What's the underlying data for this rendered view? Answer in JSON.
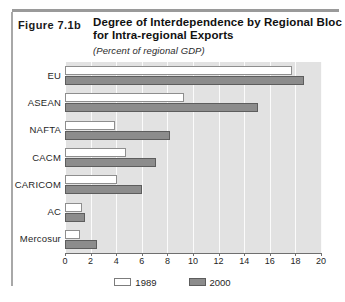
{
  "figure": {
    "label": "Figure 7.1b",
    "title": "Degree of Interdependence by Regional Bloc for Intra-regional Exports",
    "subtitle": "(Percent of regional GDP)"
  },
  "chart_data": {
    "type": "bar",
    "orientation": "horizontal",
    "title": "Degree of Interdependence by Regional Bloc for Intra-regional Exports",
    "subtitle": "(Percent of regional GDP)",
    "xlabel": "",
    "ylabel": "",
    "xlim": [
      0,
      20
    ],
    "xticks": [
      0,
      2,
      4,
      6,
      8,
      10,
      12,
      14,
      16,
      18,
      20
    ],
    "grid": true,
    "legend_position": "bottom",
    "categories": [
      "EU",
      "ASEAN",
      "NAFTA",
      "CACM",
      "CARICOM",
      "AC",
      "Mercosur"
    ],
    "series": [
      {
        "name": "1989",
        "color": "#ffffff",
        "values": [
          17.7,
          9.3,
          3.9,
          4.8,
          4.1,
          1.3,
          1.2
        ]
      },
      {
        "name": "2000",
        "color": "#8c8c8c",
        "values": [
          18.7,
          15.1,
          8.2,
          7.1,
          6.0,
          1.6,
          2.5
        ]
      }
    ]
  }
}
